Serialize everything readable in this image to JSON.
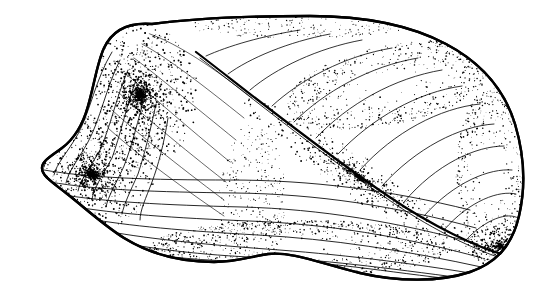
{
  "figure": {
    "technique": "pen-and-ink stipple line drawing",
    "orientation": "left valve, exterior view, anterior to left",
    "alt_text": "Black and white stippled line drawing of a bivalve mollusc shell valve seen from the exterior, with the umbo at upper left, concentric growth lines across the body, a diagonal posterior ridge running to the lower right tip, and dense stippling along the margins.",
    "caption": "",
    "background_color": "#ffffff",
    "ink_color": "#000000",
    "canvas": {
      "width": 554,
      "height": 297
    }
  },
  "anatomy": {
    "parts": [
      {
        "id": "umbo",
        "label": "Umbo (beak)",
        "x": 150,
        "y": 30
      },
      {
        "id": "dorsal-margin",
        "label": "Dorsal margin",
        "x": 330,
        "y": 48
      },
      {
        "id": "posterior-margin",
        "label": "Posterior margin",
        "x": 516,
        "y": 160
      },
      {
        "id": "ventral-margin",
        "label": "Ventral margin",
        "x": 260,
        "y": 268
      },
      {
        "id": "anterior-lobe",
        "label": "Anterior lobe",
        "x": 60,
        "y": 170
      },
      {
        "id": "posterior-ridge",
        "label": "Posterior ridge",
        "x": 360,
        "y": 160
      },
      {
        "id": "posterior-slope",
        "label": "Posterior slope",
        "x": 400,
        "y": 100
      },
      {
        "id": "growth-lines",
        "label": "Concentric growth lines",
        "x": 240,
        "y": 190
      }
    ]
  },
  "geometry": {
    "outline": "M 152 24 C 128 22 112 31 104 48 C 97 63 94 86 88 106 C 83 124 74 139 62 148 C 50 157 42 161 42 168 C 42 176 52 182 66 193 C 84 207 102 224 124 238 C 150 254 182 262 214 262 C 238 262 252 256 268 254 C 292 251 322 264 360 273 C 398 282 440 282 470 272 C 496 263 512 246 519 216 C 526 186 524 154 515 124 C 504 88 480 62 446 44 C 410 25 362 16 310 16 C 252 16 196 18 152 24 Z",
    "ridge": "M 196 52 C 248 92 320 150 388 196 C 432 226 478 248 508 256",
    "ridge_lower": "M 200 58 C 252 98 324 156 392 202 C 436 232 480 252 507 260",
    "anterior_arcs": [
      "M 104 46 C 86 70 80 104 68 126 C 58 144 46 156 44 167",
      "M 112 52 C 96 78 90 112 78 134 C 68 152 56 164 54 175",
      "M 120 60 C 106 88 100 120 88 142 C 78 160 68 172 66 183",
      "M 128 70 C 116 98 110 128 100 150 C 90 168 80 180 78 191",
      "M 136 80 C 126 108 120 136 112 158 C 102 176 94 188 92 199",
      "M 146 92 C 138 120 132 146 124 166 C 116 184 108 196 106 207",
      "M 156 104 C 150 132 144 156 138 174 C 130 192 124 204 122 214",
      "M 168 118 C 164 144 158 166 152 182 C 146 198 140 210 140 220"
    ],
    "body_growth_lines": [
      "M 44 170 C 90 178 150 180 230 180 C 310 180 390 190 470 210",
      "M 50 182 C 96 190 156 192 236 193 C 316 194 396 206 476 228",
      "M 58 194 C 104 202 164 205 242 207 C 320 209 398 222 478 244",
      "M 70 206 C 116 214 174 218 250 221 C 326 224 402 236 482 258",
      "M 84 218 C 128 226 186 231 258 235 C 330 239 404 250 486 268",
      "M 100 230 C 142 238 198 244 266 249 C 336 254 406 262 488 276",
      "M 118 242 C 158 250 212 256 272 258 C 330 260 400 270 478 280",
      "M 140 252 C 176 259 222 262 268 261 C 320 260 386 272 460 280"
    ],
    "posterior_radials": [
      "M 206 56 C 228 46 262 36 300 30",
      "M 228 74 C 250 58 288 42 330 34",
      "M 250 90 C 276 68 318 48 362 40",
      "M 272 106 C 300 80 344 56 392 48",
      "M 294 122 C 324 92 370 66 418 58",
      "M 316 138 C 348 104 394 78 442 70",
      "M 338 154 C 372 118 418 92 462 86",
      "M 360 170 C 394 132 440 108 480 104",
      "M 382 186 C 416 148 460 126 494 124",
      "M 404 202 C 436 164 476 146 504 146",
      "M 424 216 C 454 182 490 168 512 170",
      "M 444 230 C 470 200 500 190 516 194",
      "M 464 242 C 486 218 508 212 518 218"
    ],
    "upper_body_lines": [
      "M 150 34 C 178 44 214 68 252 98",
      "M 142 44 C 168 58 204 86 244 118",
      "M 134 58 C 158 76 194 106 236 140",
      "M 126 74 C 150 94 186 126 230 162",
      "M 118 92 C 142 114 180 146 226 182",
      "M 112 110 C 136 132 176 164 224 200",
      "M 108 128 C 132 150 174 182 224 216"
    ]
  },
  "stipple": {
    "description": "Dense ink stippling concentrated along the umbo, anterior lobe, ventral margin, posterior ridge and posterior slope",
    "fields": [
      {
        "id": "umbo-dense",
        "cx": 140,
        "cy": 95,
        "rx": 58,
        "ry": 72,
        "count": 1500,
        "r_min": 0.35,
        "r_max": 1.05,
        "bias": "center"
      },
      {
        "id": "anterior-lobe",
        "cx": 92,
        "cy": 175,
        "rx": 62,
        "ry": 58,
        "count": 1250,
        "r_min": 0.35,
        "r_max": 1.0,
        "bias": "center"
      },
      {
        "id": "ventral-band",
        "cx": 300,
        "cy": 248,
        "rx": 150,
        "ry": 28,
        "count": 900,
        "r_min": 0.3,
        "r_max": 0.9,
        "bias": "edge"
      },
      {
        "id": "ridge-band",
        "cx": 360,
        "cy": 178,
        "rx": 140,
        "ry": 22,
        "count": 800,
        "r_min": 0.3,
        "r_max": 0.95,
        "bias": "center",
        "rotate": 34
      },
      {
        "id": "posterior-slope",
        "cx": 390,
        "cy": 85,
        "rx": 105,
        "ry": 40,
        "count": 620,
        "r_min": 0.3,
        "r_max": 0.85,
        "bias": "edge",
        "rotate": -12
      },
      {
        "id": "posterior-margin",
        "cx": 492,
        "cy": 175,
        "rx": 36,
        "ry": 88,
        "count": 520,
        "r_min": 0.3,
        "r_max": 0.85,
        "bias": "edge"
      },
      {
        "id": "center-wash",
        "cx": 252,
        "cy": 200,
        "rx": 34,
        "ry": 76,
        "count": 340,
        "r_min": 0.3,
        "r_max": 0.75,
        "bias": "uniform"
      },
      {
        "id": "tip-dense",
        "cx": 500,
        "cy": 246,
        "rx": 30,
        "ry": 22,
        "count": 360,
        "r_min": 0.35,
        "r_max": 1.0,
        "bias": "center"
      },
      {
        "id": "dorsal-edge",
        "cx": 300,
        "cy": 26,
        "rx": 110,
        "ry": 12,
        "count": 220,
        "r_min": 0.28,
        "r_max": 0.7,
        "bias": "uniform"
      }
    ]
  }
}
